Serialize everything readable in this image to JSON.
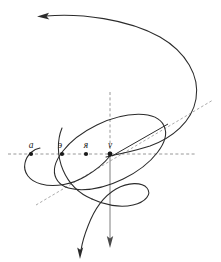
{
  "figure": {
    "background_color": "#ffffff",
    "curve_color": "#2b2b2b",
    "axis_color": "#8c8c8c",
    "label_color": "#1a1a1a",
    "width": 221,
    "height": 262
  },
  "labels": {
    "point_a": "a",
    "point_e": "э",
    "point_ya": "я",
    "point_v": "v"
  },
  "points": [
    {
      "name": "a",
      "label": "a",
      "x": 31,
      "y": 154
    },
    {
      "name": "e",
      "label": "э",
      "x": 62,
      "y": 154
    },
    {
      "name": "ya",
      "label": "я",
      "x": 86,
      "y": 154
    },
    {
      "name": "v",
      "label": "v",
      "x": 110,
      "y": 154
    }
  ],
  "axes": {
    "horizontal": {
      "style": "dashed",
      "y": 154,
      "x_start": 8,
      "x_end": 196
    },
    "vertical_upper": {
      "style": "dashed",
      "x": 110,
      "y_start": 92,
      "y_end": 154
    },
    "vertical_lower": {
      "style": "solid-arrow",
      "x": 110,
      "y_start": 154,
      "y_end": 246
    },
    "diagonal": {
      "style": "dashed",
      "x_start": 36,
      "y_start": 205,
      "x_end": 213,
      "y_end": 100
    }
  },
  "arrows": [
    {
      "name": "top-left-arrow",
      "direction": "left",
      "x": 44,
      "y": 16
    },
    {
      "name": "bottom-axis-arrow",
      "direction": "down",
      "x": 110,
      "y": 246
    },
    {
      "name": "bottom-curve-arrow",
      "direction": "down",
      "x": 80,
      "y": 257
    }
  ],
  "elements": {
    "outer_spiral": "large open spiral sweeping from upper-left arrow around the right side down through the centre",
    "ellipse": "tilted ellipse centred near the origin point v",
    "left_loop": "small loop at the far left passing through point a",
    "lower_loop": "small loop below the ellipse to the right of the vertical axis",
    "chord": "straight segment across the ellipse along the diagonal direction"
  }
}
